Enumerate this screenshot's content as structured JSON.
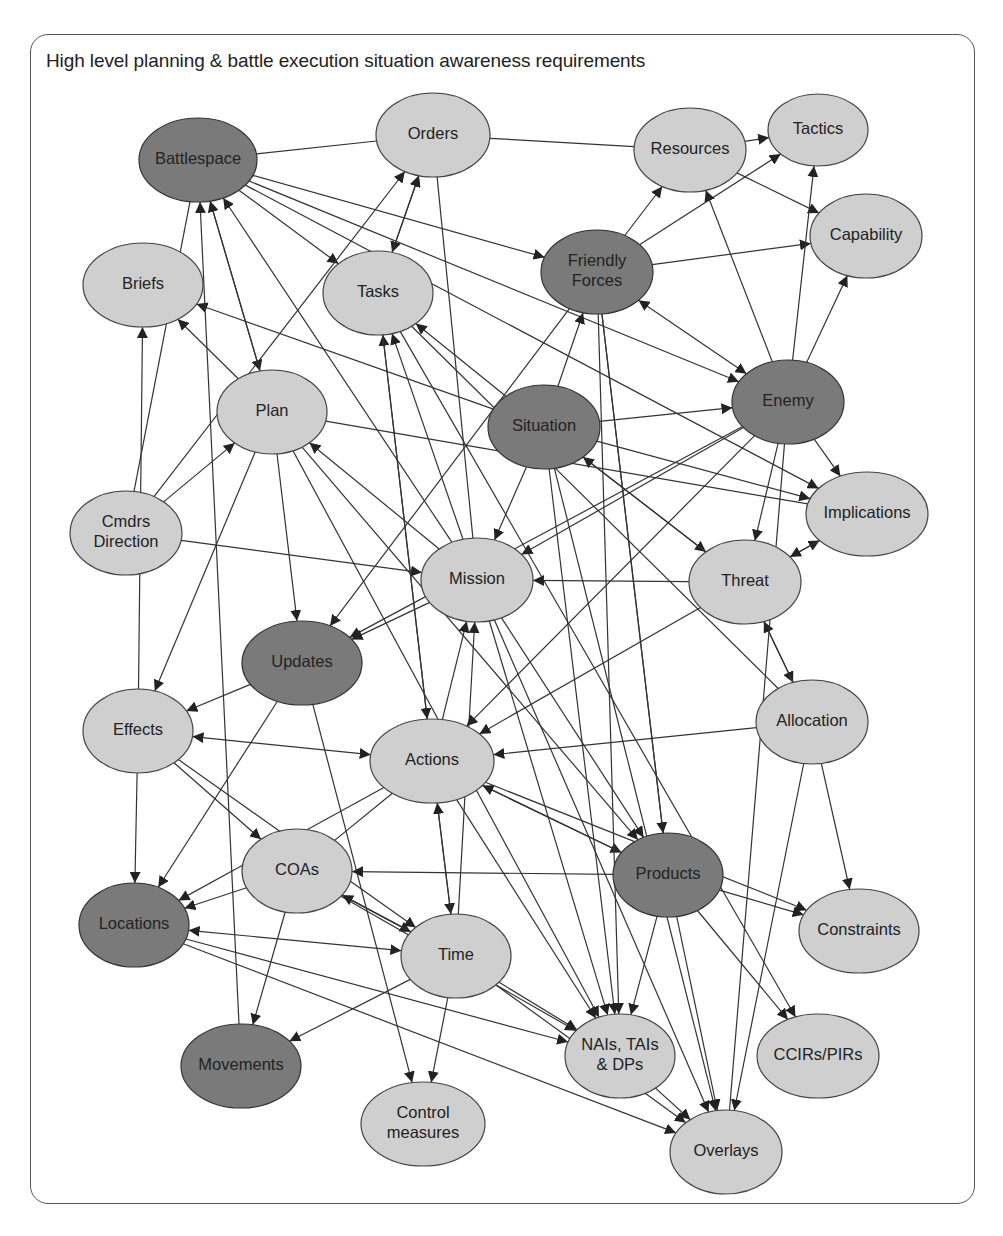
{
  "diagram": {
    "title": "High level planning & battle execution situation awareness requirements",
    "colors": {
      "light_node": "#cfcfcf",
      "dark_node": "#7a7a7a",
      "edge": "#333333",
      "frame": "#555555"
    },
    "nodes": [
      {
        "id": "orders",
        "label": [
          "Orders"
        ],
        "x": 433,
        "y": 135,
        "rx": 57,
        "ry": 42,
        "shade": "light"
      },
      {
        "id": "battlespace",
        "label": [
          "Battlespace"
        ],
        "x": 198,
        "y": 160,
        "rx": 59,
        "ry": 42,
        "shade": "dark"
      },
      {
        "id": "resources",
        "label": [
          "Resources"
        ],
        "x": 690,
        "y": 150,
        "rx": 56,
        "ry": 42,
        "shade": "light"
      },
      {
        "id": "tactics",
        "label": [
          "Tactics"
        ],
        "x": 818,
        "y": 130,
        "rx": 50,
        "ry": 36,
        "shade": "light"
      },
      {
        "id": "capability",
        "label": [
          "Capability"
        ],
        "x": 866,
        "y": 236,
        "rx": 56,
        "ry": 42,
        "shade": "light"
      },
      {
        "id": "briefs",
        "label": [
          "Briefs"
        ],
        "x": 143,
        "y": 285,
        "rx": 60,
        "ry": 42,
        "shade": "light"
      },
      {
        "id": "tasks",
        "label": [
          "Tasks"
        ],
        "x": 378,
        "y": 293,
        "rx": 55,
        "ry": 42,
        "shade": "light"
      },
      {
        "id": "friendly",
        "label": [
          "Friendly",
          "Forces"
        ],
        "x": 597,
        "y": 272,
        "rx": 56,
        "ry": 42,
        "shade": "dark"
      },
      {
        "id": "plan",
        "label": [
          "Plan"
        ],
        "x": 272,
        "y": 412,
        "rx": 55,
        "ry": 42,
        "shade": "light"
      },
      {
        "id": "situation",
        "label": [
          "Situation"
        ],
        "x": 544,
        "y": 427,
        "rx": 56,
        "ry": 42,
        "shade": "dark"
      },
      {
        "id": "enemy",
        "label": [
          "Enemy"
        ],
        "x": 788,
        "y": 402,
        "rx": 56,
        "ry": 42,
        "shade": "dark"
      },
      {
        "id": "cmdrs",
        "label": [
          "Cmdrs",
          "Direction"
        ],
        "x": 126,
        "y": 533,
        "rx": 56,
        "ry": 42,
        "shade": "light"
      },
      {
        "id": "implications",
        "label": [
          "Implications"
        ],
        "x": 867,
        "y": 514,
        "rx": 61,
        "ry": 42,
        "shade": "light"
      },
      {
        "id": "mission",
        "label": [
          "Mission"
        ],
        "x": 477,
        "y": 580,
        "rx": 56,
        "ry": 42,
        "shade": "light"
      },
      {
        "id": "threat",
        "label": [
          "Threat"
        ],
        "x": 745,
        "y": 582,
        "rx": 56,
        "ry": 42,
        "shade": "light"
      },
      {
        "id": "updates",
        "label": [
          "Updates"
        ],
        "x": 302,
        "y": 663,
        "rx": 60,
        "ry": 42,
        "shade": "dark"
      },
      {
        "id": "effects",
        "label": [
          "Effects"
        ],
        "x": 138,
        "y": 731,
        "rx": 55,
        "ry": 42,
        "shade": "light"
      },
      {
        "id": "allocation",
        "label": [
          "Allocation"
        ],
        "x": 812,
        "y": 722,
        "rx": 56,
        "ry": 42,
        "shade": "light"
      },
      {
        "id": "actions",
        "label": [
          "Actions"
        ],
        "x": 432,
        "y": 761,
        "rx": 62,
        "ry": 42,
        "shade": "light"
      },
      {
        "id": "coas",
        "label": [
          "COAs"
        ],
        "x": 297,
        "y": 871,
        "rx": 55,
        "ry": 42,
        "shade": "light"
      },
      {
        "id": "products",
        "label": [
          "Products"
        ],
        "x": 668,
        "y": 875,
        "rx": 55,
        "ry": 42,
        "shade": "dark"
      },
      {
        "id": "constraints",
        "label": [
          "Constraints"
        ],
        "x": 859,
        "y": 931,
        "rx": 60,
        "ry": 42,
        "shade": "light"
      },
      {
        "id": "locations",
        "label": [
          "Locations"
        ],
        "x": 134,
        "y": 925,
        "rx": 55,
        "ry": 42,
        "shade": "dark"
      },
      {
        "id": "time",
        "label": [
          "Time"
        ],
        "x": 456,
        "y": 956,
        "rx": 55,
        "ry": 42,
        "shade": "light"
      },
      {
        "id": "nais",
        "label": [
          "NAIs, TAIs",
          "& DPs"
        ],
        "x": 620,
        "y": 1056,
        "rx": 55,
        "ry": 42,
        "shade": "light"
      },
      {
        "id": "ccirs",
        "label": [
          "CCIRs/PIRs"
        ],
        "x": 818,
        "y": 1056,
        "rx": 61,
        "ry": 42,
        "shade": "light"
      },
      {
        "id": "movements",
        "label": [
          "Movements"
        ],
        "x": 241,
        "y": 1066,
        "rx": 60,
        "ry": 42,
        "shade": "dark"
      },
      {
        "id": "control",
        "label": [
          "Control",
          "measures"
        ],
        "x": 423,
        "y": 1124,
        "rx": 62,
        "ry": 42,
        "shade": "light"
      },
      {
        "id": "overlays",
        "label": [
          "Overlays"
        ],
        "x": 726,
        "y": 1152,
        "rx": 56,
        "ry": 42,
        "shade": "light"
      }
    ],
    "edges": [
      [
        "battlespace",
        "orders",
        0
      ],
      [
        "orders",
        "resources",
        0
      ],
      [
        "resources",
        "tactics",
        1
      ],
      [
        "resources",
        "capability",
        1
      ],
      [
        "battlespace",
        "tasks",
        1
      ],
      [
        "battlespace",
        "friendly",
        1
      ],
      [
        "battlespace",
        "enemy",
        1
      ],
      [
        "battlespace",
        "implications",
        1
      ],
      [
        "battlespace",
        "plan",
        1
      ],
      [
        "orders",
        "tasks",
        2
      ],
      [
        "tasks",
        "orders",
        1
      ],
      [
        "friendly",
        "resources",
        1
      ],
      [
        "friendly",
        "tactics",
        1
      ],
      [
        "friendly",
        "capability",
        1
      ],
      [
        "friendly",
        "enemy",
        2
      ],
      [
        "enemy",
        "tactics",
        1
      ],
      [
        "enemy",
        "capability",
        1
      ],
      [
        "enemy",
        "resources",
        1
      ],
      [
        "enemy",
        "implications",
        1
      ],
      [
        "enemy",
        "threat",
        1
      ],
      [
        "enemy",
        "mission",
        1
      ],
      [
        "enemy",
        "updates",
        1
      ],
      [
        "situation",
        "friendly",
        1
      ],
      [
        "situation",
        "enemy",
        1
      ],
      [
        "situation",
        "tasks",
        1
      ],
      [
        "situation",
        "briefs",
        1
      ],
      [
        "situation",
        "implications",
        1
      ],
      [
        "situation",
        "threat",
        1
      ],
      [
        "situation",
        "mission",
        1
      ],
      [
        "threat",
        "situation",
        1
      ],
      [
        "plan",
        "briefs",
        1
      ],
      [
        "plan",
        "battlespace",
        1
      ],
      [
        "plan",
        "updates",
        1
      ],
      [
        "plan",
        "implications",
        0
      ],
      [
        "plan",
        "effects",
        1
      ],
      [
        "plan",
        "products",
        1
      ],
      [
        "plan",
        "nais",
        1
      ],
      [
        "cmdrs",
        "plan",
        1
      ],
      [
        "cmdrs",
        "orders",
        1
      ],
      [
        "cmdrs",
        "mission",
        1
      ],
      [
        "cmdrs",
        "battlespace",
        0
      ],
      [
        "mission",
        "plan",
        1
      ],
      [
        "mission",
        "tasks",
        1
      ],
      [
        "mission",
        "battlespace",
        1
      ],
      [
        "mission",
        "updates",
        1
      ],
      [
        "mission",
        "orders",
        0
      ],
      [
        "mission",
        "products",
        1
      ],
      [
        "mission",
        "nais",
        1
      ],
      [
        "mission",
        "overlays",
        1
      ],
      [
        "threat",
        "mission",
        1
      ],
      [
        "threat",
        "implications",
        1
      ],
      [
        "threat",
        "allocation",
        1
      ],
      [
        "allocation",
        "threat",
        1
      ],
      [
        "threat",
        "actions",
        1
      ],
      [
        "implications",
        "threat",
        1
      ],
      [
        "updates",
        "effects",
        1
      ],
      [
        "updates",
        "locations",
        1
      ],
      [
        "updates",
        "control",
        1
      ],
      [
        "friendly",
        "updates",
        1
      ],
      [
        "effects",
        "actions",
        2
      ],
      [
        "effects",
        "locations",
        1
      ],
      [
        "effects",
        "coas",
        1
      ],
      [
        "effects",
        "time",
        1
      ],
      [
        "effects",
        "briefs",
        1
      ],
      [
        "allocation",
        "actions",
        1
      ],
      [
        "allocation",
        "overlays",
        1
      ],
      [
        "allocation",
        "constraints",
        1
      ],
      [
        "allocation",
        "tasks",
        0
      ],
      [
        "actions",
        "mission",
        1
      ],
      [
        "actions",
        "tasks",
        1
      ],
      [
        "actions",
        "time",
        1
      ],
      [
        "actions",
        "nais",
        1
      ],
      [
        "actions",
        "constraints",
        1
      ],
      [
        "actions",
        "products",
        1
      ],
      [
        "products",
        "actions",
        1
      ],
      [
        "actions",
        "locations",
        1
      ],
      [
        "coas",
        "locations",
        1
      ],
      [
        "coas",
        "movements",
        1
      ],
      [
        "coas",
        "time",
        1
      ],
      [
        "coas",
        "nais",
        1
      ],
      [
        "coas",
        "actions",
        0
      ],
      [
        "products",
        "coas",
        1
      ],
      [
        "products",
        "constraints",
        1
      ],
      [
        "products",
        "ccirs",
        1
      ],
      [
        "products",
        "overlays",
        1
      ],
      [
        "products",
        "nais",
        1
      ],
      [
        "products",
        "friendly",
        0
      ],
      [
        "time",
        "coas",
        1
      ],
      [
        "time",
        "locations",
        2
      ],
      [
        "time",
        "mission",
        1
      ],
      [
        "time",
        "actions",
        1
      ],
      [
        "time",
        "control",
        1
      ],
      [
        "time",
        "nais",
        1
      ],
      [
        "time",
        "movements",
        1
      ],
      [
        "time",
        "overlays",
        1
      ],
      [
        "locations",
        "nais",
        1
      ],
      [
        "locations",
        "overlays",
        1
      ],
      [
        "nais",
        "overlays",
        1
      ],
      [
        "movements",
        "battlespace",
        1
      ],
      [
        "tasks",
        "actions",
        1
      ],
      [
        "tasks",
        "ccirs",
        1
      ],
      [
        "situation",
        "overlays",
        1
      ],
      [
        "situation",
        "nais",
        1
      ],
      [
        "friendly",
        "nais",
        1
      ],
      [
        "friendly",
        "products",
        1
      ],
      [
        "enemy",
        "actions",
        1
      ],
      [
        "enemy",
        "overlays",
        0
      ]
    ]
  }
}
